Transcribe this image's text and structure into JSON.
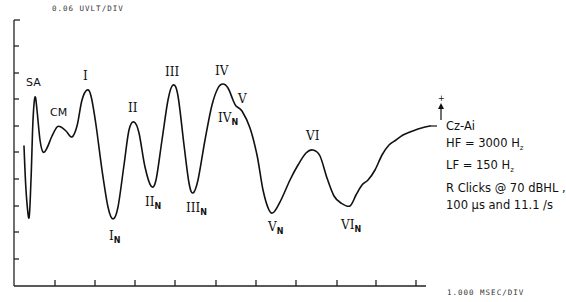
{
  "chart_data": {
    "type": "line",
    "title": "",
    "y_scale_label": "0.06 UVLT/DIV",
    "x_scale_label": "1.000 MSEC/DIV",
    "xlabel": "Time (1.000 msec/div)",
    "ylabel": "Amplitude (0.06 uV/div)",
    "grid": false,
    "x_divisions": 10,
    "y_divisions": 10,
    "series": [
      {
        "name": "Cz-Ai",
        "description": "Auditory brainstem response waveform",
        "points_px": [
          [
            24,
            146
          ],
          [
            26,
            190
          ],
          [
            29,
            218
          ],
          [
            31,
            180
          ],
          [
            33,
            120
          ],
          [
            35,
            97
          ],
          [
            37,
            110
          ],
          [
            40,
            140
          ],
          [
            43,
            152
          ],
          [
            47,
            148
          ],
          [
            52,
            136
          ],
          [
            57,
            127
          ],
          [
            61,
            127
          ],
          [
            66,
            131
          ],
          [
            72,
            137
          ],
          [
            77,
            126
          ],
          [
            82,
            100
          ],
          [
            87,
            90
          ],
          [
            91,
            96
          ],
          [
            96,
            125
          ],
          [
            102,
            170
          ],
          [
            108,
            207
          ],
          [
            113,
            219
          ],
          [
            118,
            207
          ],
          [
            124,
            165
          ],
          [
            129,
            130
          ],
          [
            134,
            122
          ],
          [
            139,
            133
          ],
          [
            145,
            167
          ],
          [
            151,
            186
          ],
          [
            156,
            180
          ],
          [
            162,
            140
          ],
          [
            168,
            100
          ],
          [
            173,
            85
          ],
          [
            178,
            96
          ],
          [
            184,
            145
          ],
          [
            189,
            183
          ],
          [
            193,
            193
          ],
          [
            198,
            180
          ],
          [
            205,
            140
          ],
          [
            212,
            105
          ],
          [
            218,
            88
          ],
          [
            223,
            84
          ],
          [
            228,
            88
          ],
          [
            233,
            100
          ],
          [
            236,
            106
          ],
          [
            242,
            111
          ],
          [
            250,
            128
          ],
          [
            257,
            155
          ],
          [
            263,
            190
          ],
          [
            269,
            210
          ],
          [
            274,
            212
          ],
          [
            281,
            200
          ],
          [
            290,
            180
          ],
          [
            298,
            165
          ],
          [
            306,
            153
          ],
          [
            313,
            150
          ],
          [
            320,
            156
          ],
          [
            327,
            178
          ],
          [
            334,
            196
          ],
          [
            341,
            203
          ],
          [
            350,
            206
          ],
          [
            356,
            195
          ],
          [
            362,
            185
          ],
          [
            368,
            180
          ],
          [
            375,
            170
          ],
          [
            382,
            155
          ],
          [
            389,
            145
          ],
          [
            396,
            140
          ],
          [
            403,
            135
          ],
          [
            410,
            132
          ],
          [
            418,
            129
          ],
          [
            425,
            127
          ],
          [
            430,
            126
          ]
        ]
      }
    ],
    "peaks": [
      {
        "label": "SA",
        "x_ms": 0.5,
        "type": "peak"
      },
      {
        "label": "CM",
        "x_ms": 1.1,
        "type": "peak"
      },
      {
        "label": "I",
        "x_ms": 1.8,
        "type": "peak"
      },
      {
        "label": "I_N",
        "x_ms": 2.5,
        "type": "trough"
      },
      {
        "label": "II",
        "x_ms": 3.0,
        "type": "peak"
      },
      {
        "label": "II_N",
        "x_ms": 3.4,
        "type": "trough"
      },
      {
        "label": "III",
        "x_ms": 4.0,
        "type": "peak"
      },
      {
        "label": "III_N",
        "x_ms": 4.5,
        "type": "trough"
      },
      {
        "label": "IV",
        "x_ms": 5.2,
        "type": "peak"
      },
      {
        "label": "V",
        "x_ms": 5.5,
        "type": "peak"
      },
      {
        "label": "IV_N",
        "x_ms": 5.5,
        "type": "trough"
      },
      {
        "label": "V_N",
        "x_ms": 6.5,
        "type": "trough"
      },
      {
        "label": "VI",
        "x_ms": 7.4,
        "type": "peak"
      },
      {
        "label": "VI_N",
        "x_ms": 8.4,
        "type": "trough"
      }
    ],
    "annotations": [
      "Cz-Ai",
      "HF = 3000 Hz",
      "LF = 150 Hz",
      "R Clicks @ 70 dBHL ,",
      "100 µs and 11.1 /s"
    ]
  },
  "labels": {
    "y_scale": "0.06 UVLT/DIV",
    "x_scale": "1.000 MSEC/DIV",
    "polarity_plus": "+",
    "montage": "Cz-Ai",
    "hf": "HF = 3000 H",
    "hf_unit_sub": "z",
    "lf": "LF = 150 H",
    "lf_unit_sub": "z",
    "stimulus": "R Clicks @ 70 dBHL ,",
    "duration_rate": "100 µs and 11.1 /s"
  },
  "peak_labels": {
    "sa": "SA",
    "cm": "CM",
    "i": "I",
    "ii": "II",
    "iii": "III",
    "iv": "IV",
    "v": "V",
    "vi": "VI",
    "i_n": "I",
    "ii_n": "II",
    "iii_n": "III",
    "iv_n": "IV",
    "v_n": "V",
    "vi_n": "VI",
    "n_sub": "N"
  }
}
